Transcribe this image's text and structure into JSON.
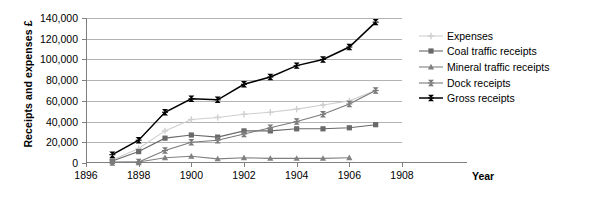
{
  "chart_data": {
    "type": "line",
    "title": "",
    "xlabel": "Year",
    "ylabel": "Receipts and expenses £",
    "xlim": [
      1896,
      1908
    ],
    "ylim": [
      0,
      140000
    ],
    "xticks": [
      1896,
      1898,
      1900,
      1902,
      1904,
      1906,
      1908
    ],
    "yticks": [
      0,
      20000,
      40000,
      60000,
      80000,
      100000,
      120000,
      140000
    ],
    "ytick_labels": [
      "0",
      "20,000",
      "40,000",
      "60,000",
      "80,000",
      "100,000",
      "120,000",
      "140,000"
    ],
    "xtick_labels": [
      "1896",
      "1898",
      "1900",
      "1902",
      "1904",
      "1906",
      "1908"
    ],
    "grid": "horizontal",
    "legend_position": "right",
    "x": [
      1897,
      1898,
      1899,
      1900,
      1901,
      1902,
      1903,
      1904,
      1905,
      1906,
      1907
    ],
    "series": [
      {
        "name": "Expenses",
        "marker": "plus",
        "color": "#cfcfcf",
        "values": [
          3000,
          14000,
          31000,
          42000,
          44000,
          47000,
          49000,
          52000,
          56000,
          60000,
          70000
        ]
      },
      {
        "name": "Coal traffic receipts",
        "marker": "square",
        "color": "#696969",
        "values": [
          2000,
          11000,
          24000,
          27000,
          25000,
          31000,
          31000,
          33000,
          33000,
          34000,
          37000
        ]
      },
      {
        "name": "Mineral traffic receipts",
        "marker": "triangle",
        "color": "#808080",
        "values": [
          1000,
          1000,
          5000,
          6500,
          4000,
          5000,
          4500,
          4500,
          4500,
          5000,
          null
        ]
      },
      {
        "name": "Dock receipts",
        "marker": "bowtie",
        "color": "#7a7a7a",
        "values": [
          500,
          1000,
          12000,
          20000,
          22000,
          28000,
          34000,
          40000,
          47000,
          57000,
          70000
        ]
      },
      {
        "name": "Gross receipts",
        "marker": "bowtie",
        "color": "#000000",
        "values": [
          8000,
          22000,
          49000,
          62000,
          61000,
          76000,
          83000,
          94000,
          100000,
          112000,
          136000
        ]
      }
    ]
  },
  "legend": {
    "items": [
      {
        "label": "Expenses"
      },
      {
        "label": "Coal traffic receipts"
      },
      {
        "label": "Mineral traffic receipts"
      },
      {
        "label": "Dock receipts"
      },
      {
        "label": "Gross receipts"
      }
    ]
  }
}
